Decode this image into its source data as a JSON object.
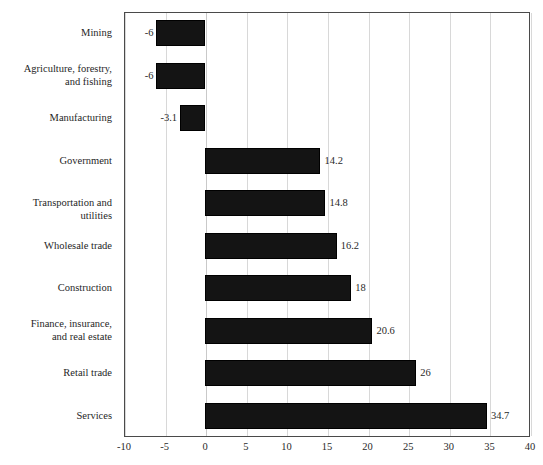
{
  "chart_data": {
    "type": "bar",
    "orientation": "horizontal",
    "title": "",
    "xlabel": "",
    "ylabel": "",
    "xlim": [
      -10,
      40
    ],
    "xticks": [
      "-10",
      "-5",
      "0",
      "5",
      "10",
      "15",
      "20",
      "25",
      "30",
      "35",
      "40"
    ],
    "grid": true,
    "legend": null,
    "bar_color": "#141414",
    "categories": [
      "Mining",
      "Agriculture, forestry,\nand fishing",
      "Manufacturing",
      "Government",
      "Transportation and utilities",
      "Wholesale trade",
      "Construction",
      "Finance, insurance,\nand real estate",
      "Retail trade",
      "Services"
    ],
    "values": [
      -6,
      -6,
      -3.1,
      14.2,
      14.8,
      16.2,
      18,
      20.6,
      26,
      34.7
    ],
    "value_labels": [
      "-6",
      "-6",
      "-3.1",
      "14.2",
      "14.8",
      "16.2",
      "18",
      "20.6",
      "26",
      "34.7"
    ]
  }
}
